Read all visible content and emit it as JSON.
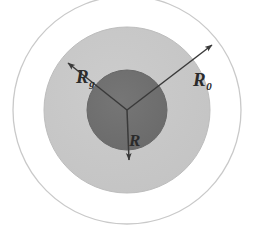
{
  "figure": {
    "name": "concentric-radii-diagram",
    "type": "concentric-circle-schematic",
    "background_color": "#ffffff",
    "center": {
      "x": 127,
      "y": 110
    },
    "circles": [
      {
        "name": "outer-circle",
        "label": "R_0",
        "radius": 114,
        "fill_color": "#ffffff",
        "stroke_color": "#c9c9c9"
      },
      {
        "name": "middle-circle",
        "label": "R_g",
        "radius": 83,
        "fill_color": "#c8c8c8",
        "stroke_color": "#bdbdbd"
      },
      {
        "name": "inner-circle",
        "label": "R",
        "radius": 40,
        "fill_color": "#6e6e6e",
        "stroke_color": "#676767"
      }
    ],
    "arrows": [
      {
        "name": "arrow-rg",
        "label_symbol": "R",
        "label_subscript": "g",
        "from": {
          "x": 127,
          "y": 110
        },
        "to": {
          "x": 68,
          "y": 63
        },
        "color": "#3a3a3a"
      },
      {
        "name": "arrow-r0",
        "label_symbol": "R",
        "label_subscript": "0",
        "from": {
          "x": 127,
          "y": 110
        },
        "to": {
          "x": 212,
          "y": 45
        },
        "color": "#3a3a3a"
      },
      {
        "name": "arrow-r",
        "label_symbol": "R",
        "label_subscript": "",
        "from": {
          "x": 127,
          "y": 110
        },
        "to": {
          "x": 129,
          "y": 160
        },
        "color": "#3a3a3a"
      }
    ],
    "labels": {
      "rg": {
        "symbol": "R",
        "subscript": "g"
      },
      "r0": {
        "symbol": "R",
        "subscript": "0"
      },
      "r": {
        "symbol": "R",
        "subscript": ""
      }
    }
  }
}
